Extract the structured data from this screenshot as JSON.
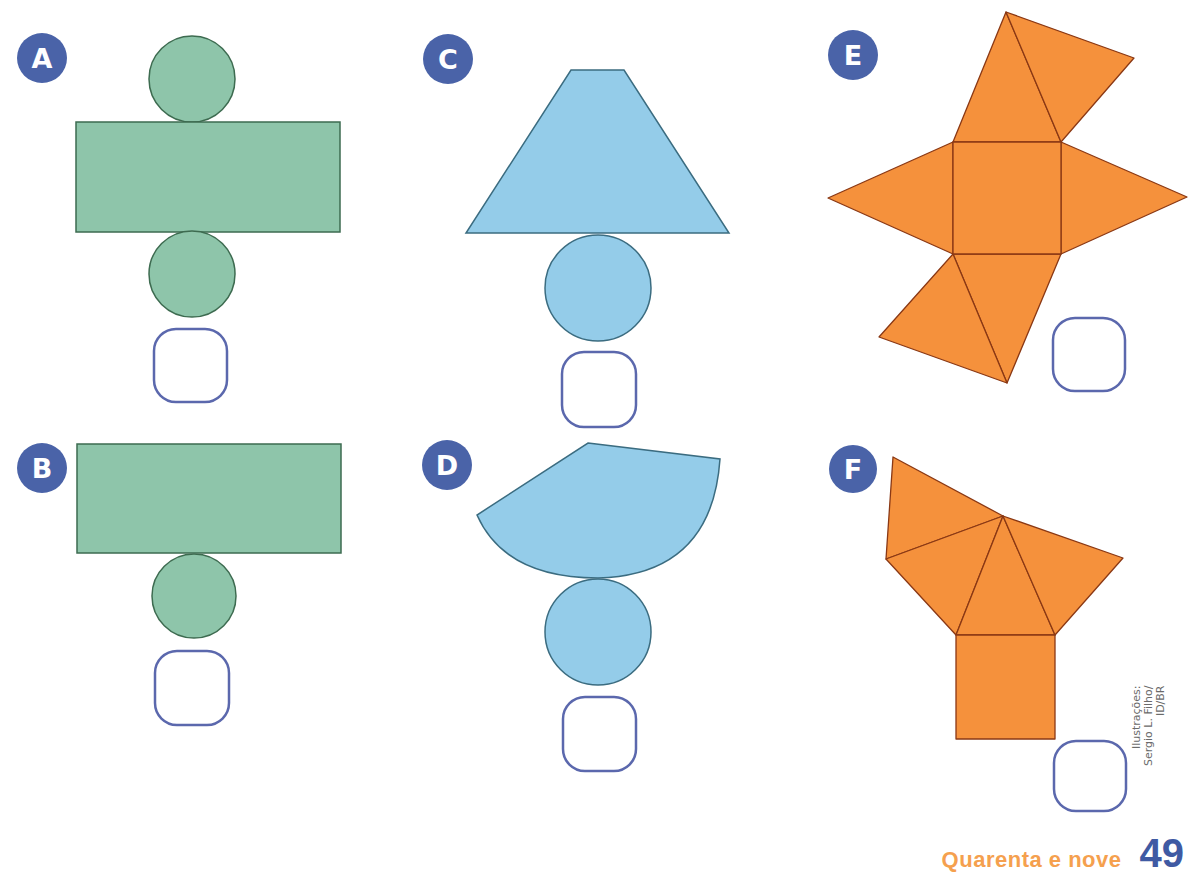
{
  "colors": {
    "label_bg": "#4a63a8",
    "green_fill": "#8ec5aa",
    "green_stroke": "#3d6b50",
    "blue_fill": "#94cce9",
    "blue_stroke": "#3b6c80",
    "orange_fill": "#f5913c",
    "orange_stroke": "#8a3814",
    "answer_box_stroke": "#5b68ad",
    "footer_word": "#f5a04e",
    "footer_number": "#3f5aa3"
  },
  "nets": [
    {
      "label": "A",
      "shape": "cylinder net (rectangle + two circles)",
      "answer": ""
    },
    {
      "label": "B",
      "shape": "rectangle + one circle",
      "answer": ""
    },
    {
      "label": "C",
      "shape": "trapezoid + circle",
      "answer": ""
    },
    {
      "label": "D",
      "shape": "circular sector + circle (cone net)",
      "answer": ""
    },
    {
      "label": "E",
      "shape": "square + four triangles (pyramid net)",
      "answer": ""
    },
    {
      "label": "F",
      "shape": "square + four triangles",
      "answer": ""
    }
  ],
  "credit": {
    "line1": "Ilustrações:",
    "line2": "Sergio L. Filho/",
    "line3": "ID/BR"
  },
  "footer": {
    "page_word": "Quarenta e nove",
    "page_number": "49"
  }
}
